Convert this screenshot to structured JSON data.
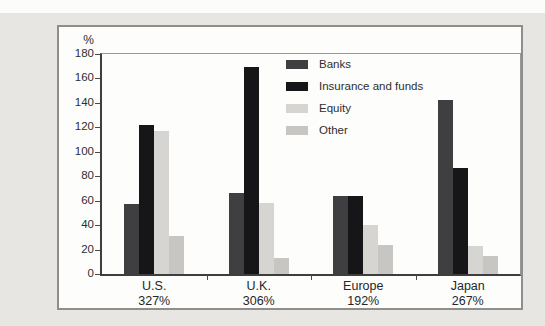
{
  "page": {
    "background_color": "#e7e6e2",
    "top_strip_color": "#fcfcfb",
    "chart_box_border_color": "#8e8e8c",
    "chart_box_background": "#fdfdfc"
  },
  "chart_data": {
    "type": "bar",
    "title": "",
    "ylabel": "%",
    "xlabel": "",
    "ylim": [
      0,
      180
    ],
    "ytick_step": 20,
    "yticks": [
      0,
      20,
      40,
      60,
      80,
      100,
      120,
      140,
      160,
      180
    ],
    "grid": false,
    "legend_position": "top-center-inside",
    "categories": [
      "U.S.",
      "U.K.",
      "Europe",
      "Japan"
    ],
    "category_totals": [
      "327%",
      "306%",
      "192%",
      "267%"
    ],
    "series": [
      {
        "name": "Banks",
        "color": "#3f3f41",
        "values": [
          57,
          66,
          64,
          142
        ]
      },
      {
        "name": "Insurance and funds",
        "color": "#161618",
        "values": [
          122,
          169,
          64,
          87
        ]
      },
      {
        "name": "Equity",
        "color": "#d6d5d1",
        "values": [
          117,
          58,
          40,
          23
        ]
      },
      {
        "name": "Other",
        "color": "#c7c6c2",
        "values": [
          31,
          13,
          24,
          15
        ]
      }
    ],
    "axis_color": "#3e3e3e",
    "tick_color": "#4a4a4a",
    "text_color": "#2e2e2e"
  }
}
